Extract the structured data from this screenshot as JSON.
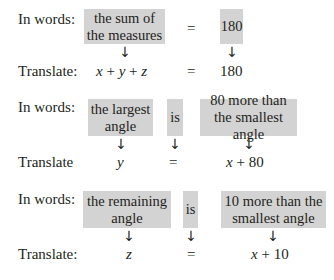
{
  "rows": [
    {
      "words_label": "In words:",
      "translate_label": "Translate:",
      "boxes": [
        "the sum of the measures",
        "180"
      ],
      "equals": "=",
      "equation": {
        "left_vars": [
          "x",
          "y",
          "z"
        ],
        "plus": "+",
        "equals": "=",
        "right": "180"
      }
    },
    {
      "words_label": "In words:",
      "translate_label": "Translate",
      "boxes": [
        "the largest angle",
        "is",
        "80 more than the smallest angle"
      ],
      "equation": {
        "left": "y",
        "equals": "=",
        "right_var": "x",
        "plus": "+",
        "right_num": "80"
      }
    },
    {
      "words_label": "In words:",
      "translate_label": "Translate:",
      "boxes": [
        "the remaining angle",
        "is",
        "10 more than the smallest angle"
      ],
      "equation": {
        "left": "z",
        "equals": "=",
        "right_var": "x",
        "plus": "+",
        "right_num": "10"
      }
    }
  ],
  "arrow_glyph": "↓"
}
